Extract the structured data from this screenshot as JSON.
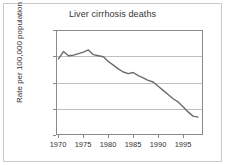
{
  "chart_data": {
    "type": "line",
    "title": "Liver cirrhosis deaths",
    "xlabel": "",
    "ylabel": "Rate per 100,000 population",
    "xlim": [
      1969.5,
      1999
    ],
    "ylim": [
      10,
      30
    ],
    "xticks": [
      "1970",
      "1975",
      "1980",
      "1985",
      "1990",
      "1995"
    ],
    "xtick_values": [
      1970,
      1975,
      1980,
      1985,
      1990,
      1995
    ],
    "yticks": [
      "10",
      "15",
      "20",
      "25",
      "30"
    ],
    "ytick_values": [
      10,
      15,
      20,
      25,
      30
    ],
    "grid": "horizontal",
    "legend": "none",
    "line_color": "#6b6b6b",
    "series": [
      {
        "name": "Liver cirrhosis death rate",
        "x": [
          1970,
          1971,
          1972,
          1973,
          1974,
          1975,
          1976,
          1977,
          1978,
          1979,
          1980,
          1981,
          1982,
          1983,
          1984,
          1985,
          1986,
          1987,
          1988,
          1989,
          1990,
          1991,
          1992,
          1993,
          1994,
          1995,
          1996,
          1997,
          1998
        ],
        "values": [
          24.5,
          25.9,
          25.1,
          25.2,
          25.5,
          25.8,
          26.2,
          25.3,
          25.1,
          24.9,
          24.0,
          23.3,
          22.6,
          22.0,
          21.7,
          21.9,
          21.3,
          20.9,
          20.4,
          20.1,
          19.3,
          18.5,
          17.7,
          16.9,
          16.3,
          15.4,
          14.4,
          13.6,
          13.4
        ]
      }
    ]
  },
  "yaxis": {
    "ticks": [
      {
        "label": "30",
        "value": 30
      },
      {
        "label": "25",
        "value": 25
      },
      {
        "label": "20",
        "value": 20
      },
      {
        "label": "15",
        "value": 15
      },
      {
        "label": "10",
        "value": 10
      }
    ]
  },
  "xaxis": {
    "ticks": [
      {
        "label": "1970",
        "value": 1970
      },
      {
        "label": "1975",
        "value": 1975
      },
      {
        "label": "1980",
        "value": 1980
      },
      {
        "label": "1985",
        "value": 1985
      },
      {
        "label": "1990",
        "value": 1990
      },
      {
        "label": "1995",
        "value": 1995
      }
    ]
  }
}
